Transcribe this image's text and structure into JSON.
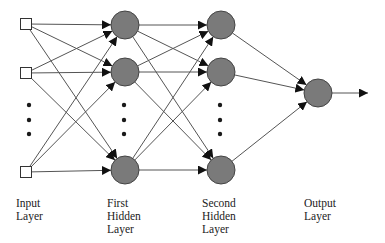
{
  "diagram": {
    "type": "feedforward-neural-network",
    "colors": {
      "edge": "#555555",
      "arrowhead": "#111111",
      "node_fill": "#7a7a7a",
      "node_stroke": "#444444",
      "input_fill": "#ffffff",
      "input_stroke": "#333333",
      "dot": "#1a1a1a"
    },
    "layers": [
      {
        "id": "input",
        "label": "Input\nLayer",
        "node_shape": "square",
        "x": 26,
        "nodes_y": [
          24,
          73,
          172
        ],
        "ellipsis_y": [
          105,
          120,
          134
        ],
        "label_x": 16
      },
      {
        "id": "hidden1",
        "label": "First\nHidden\nLayer",
        "node_shape": "circle",
        "x": 125,
        "nodes_y": [
          25,
          72,
          170
        ],
        "ellipsis_y": [
          105,
          120,
          134
        ],
        "label_x": 107
      },
      {
        "id": "hidden2",
        "label": "Second\nHidden\nLayer",
        "node_shape": "circle",
        "x": 221,
        "nodes_y": [
          25,
          72,
          170
        ],
        "ellipsis_y": [
          105,
          120,
          134
        ],
        "label_x": 202
      },
      {
        "id": "output",
        "label": "Output\nLayer",
        "node_shape": "circle",
        "x": 318,
        "nodes_y": [
          93
        ],
        "ellipsis_y": [],
        "label_x": 304
      }
    ],
    "output_arrow_end_x": 368,
    "label_top_y": 197
  }
}
